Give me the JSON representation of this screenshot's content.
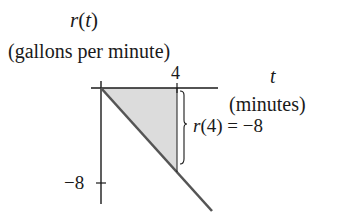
{
  "diagram": {
    "y_axis": {
      "title": "r(t)",
      "title_func": "r",
      "title_var": "t",
      "units": "(gallons per minute)",
      "tick_label": "−8",
      "tick_value": -8
    },
    "x_axis": {
      "title": "t",
      "units": "(minutes)",
      "tick_label": "4",
      "tick_value": 4
    },
    "annotation": {
      "text_func": "r",
      "text_arg": "(4) = −8",
      "full": "r(4) = −8"
    },
    "colors": {
      "line": "#555555",
      "axis": "#1a1a1a",
      "shade": "#d9d9d9"
    }
  }
}
